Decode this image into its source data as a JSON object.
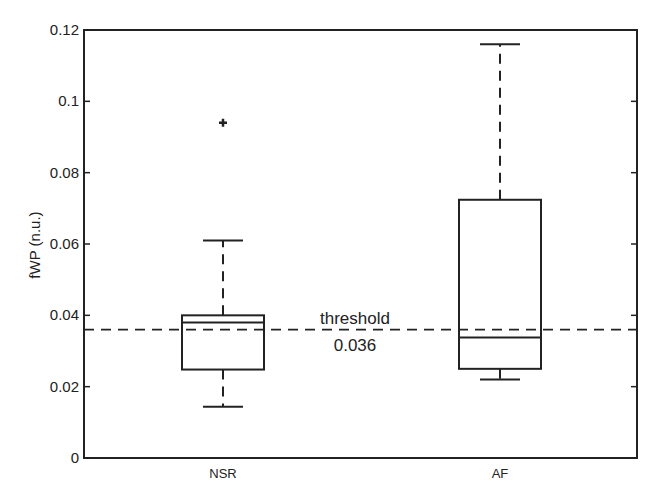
{
  "chart_data": {
    "type": "box",
    "title": "",
    "xlabel": "",
    "ylabel": "fWP (n.u.)",
    "ylim": [
      0,
      0.12
    ],
    "yticks": [
      0,
      0.02,
      0.04,
      0.06,
      0.08,
      0.1,
      0.12
    ],
    "ytick_labels": [
      "0",
      "0.02",
      "0.04",
      "0.06",
      "0.08",
      "0.1",
      "0.12"
    ],
    "categories": [
      "NSR",
      "AF"
    ],
    "grid": false,
    "legend": null,
    "boxes": [
      {
        "name": "NSR",
        "whisker_low": 0.0144,
        "q1": 0.0248,
        "median": 0.038,
        "q3": 0.04,
        "whisker_high": 0.061,
        "outliers": [
          0.094
        ]
      },
      {
        "name": "AF",
        "whisker_low": 0.022,
        "q1": 0.025,
        "median": 0.0338,
        "q3": 0.0724,
        "whisker_high": 0.116,
        "outliers": []
      }
    ],
    "reference_line": {
      "value": 0.036,
      "style": "dashed",
      "label_top": "threshold",
      "label_bottom": "0.036"
    }
  }
}
